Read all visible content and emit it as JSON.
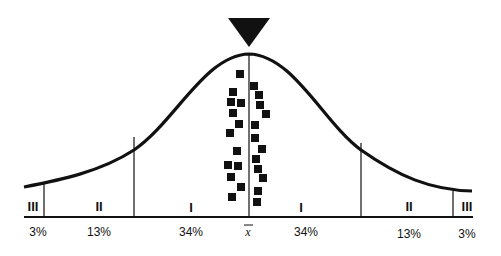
{
  "diagram": {
    "type": "normal-distribution-bell-curve",
    "marker": "down-triangle at mean",
    "mean_label": "x",
    "zones": [
      {
        "id": "left-III",
        "roman": "III",
        "percent": "3%"
      },
      {
        "id": "left-II",
        "roman": "II",
        "percent": "13%"
      },
      {
        "id": "left-I",
        "roman": "I",
        "percent": "34%"
      },
      {
        "id": "right-I",
        "roman": "I",
        "percent": "34%"
      },
      {
        "id": "right-II",
        "roman": "II",
        "percent": "13%"
      },
      {
        "id": "right-III",
        "roman": "III",
        "percent": "3%"
      }
    ],
    "colors": {
      "ink": "#111111",
      "background": "#ffffff"
    },
    "data_points_left": 13,
    "data_points_right": 12
  }
}
